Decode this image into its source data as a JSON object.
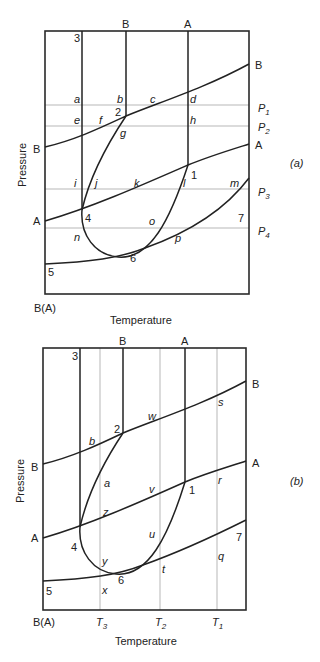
{
  "diagrams": [
    {
      "panel": "(a)",
      "xlabel": "Temperature",
      "ylabel": "Pressure",
      "corner_label": "B(A)",
      "top_labels": [
        "B",
        "A"
      ],
      "right_labels": [
        "B",
        "A"
      ],
      "left_labels": [
        "B",
        "A"
      ],
      "invariant_points": [
        "1",
        "2",
        "3",
        "4",
        "5",
        "6",
        "7"
      ],
      "isobars": [
        {
          "name": "P",
          "sub": "1"
        },
        {
          "name": "P",
          "sub": "2"
        },
        {
          "name": "P",
          "sub": "3"
        },
        {
          "name": "P",
          "sub": "4"
        }
      ],
      "point_letters": [
        "a",
        "b",
        "c",
        "d",
        "e",
        "f",
        "g",
        "h",
        "i",
        "j",
        "k",
        "l",
        "m",
        "n",
        "o",
        "p"
      ]
    },
    {
      "panel": "(b)",
      "xlabel": "Temperature",
      "ylabel": "Pressure",
      "corner_label": "B(A)",
      "top_labels": [
        "B",
        "A"
      ],
      "right_labels": [
        "B",
        "A"
      ],
      "left_labels": [
        "B",
        "A"
      ],
      "invariant_points": [
        "1",
        "2",
        "3",
        "4",
        "5",
        "6",
        "7"
      ],
      "isotherms": [
        {
          "name": "T",
          "sub": "3"
        },
        {
          "name": "T",
          "sub": "2"
        },
        {
          "name": "T",
          "sub": "1"
        }
      ],
      "point_letters": [
        "a",
        "b",
        "q",
        "r",
        "s",
        "t",
        "u",
        "v",
        "w",
        "x",
        "y",
        "z"
      ]
    }
  ]
}
